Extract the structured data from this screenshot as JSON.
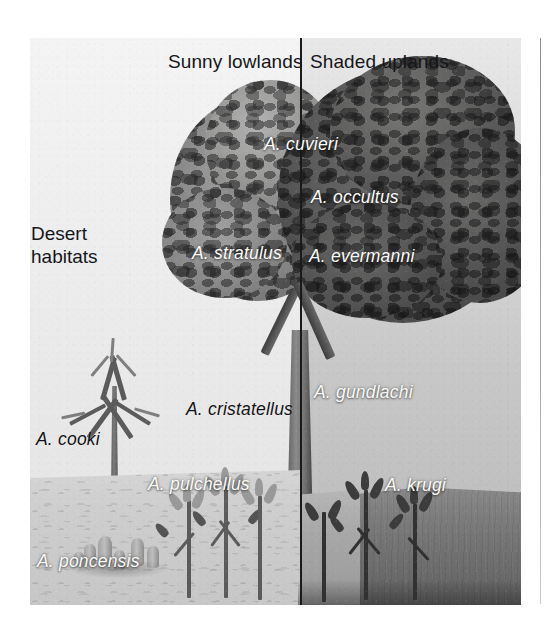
{
  "figure": {
    "headers": [
      {
        "text": "Sunny lowlands",
        "x": 168,
        "y": 51
      },
      {
        "text": "Shaded uplands",
        "x": 310,
        "y": 51
      }
    ],
    "region_title": {
      "line1": "Desert",
      "line2": "habitats",
      "x": 31,
      "y": 222
    },
    "divider": {
      "label": "habitat-divider",
      "x": 300
    },
    "species_labels": [
      {
        "name": "A. cuvieri",
        "x": 264,
        "y": 134,
        "color": "white"
      },
      {
        "name": "A. occultus",
        "x": 311,
        "y": 187,
        "color": "white"
      },
      {
        "name": "A. stratulus",
        "x": 192,
        "y": 243,
        "color": "white"
      },
      {
        "name": "A. evermanni",
        "x": 309,
        "y": 246,
        "color": "white"
      },
      {
        "name": "A. gundlachi",
        "x": 314,
        "y": 382,
        "color": "white"
      },
      {
        "name": "A. cristatellus",
        "x": 186,
        "y": 399,
        "color": "black"
      },
      {
        "name": "A. cooki",
        "x": 36,
        "y": 429,
        "color": "black"
      },
      {
        "name": "A. krugi",
        "x": 385,
        "y": 475,
        "color": "white"
      },
      {
        "name": "A. pulchellus",
        "x": 148,
        "y": 474,
        "color": "white"
      },
      {
        "name": "A. poncensis",
        "x": 37,
        "y": 551,
        "color": "white"
      }
    ],
    "colors": {
      "divider": "#1a1a18",
      "label_white": "#fbfbf9",
      "label_black": "#141416",
      "sky_sunny": "#f1f1ef",
      "sky_shaded": "#c8c8c6",
      "ground_desert": "#cfcec9",
      "ground_upland": "#6e6d69"
    }
  }
}
